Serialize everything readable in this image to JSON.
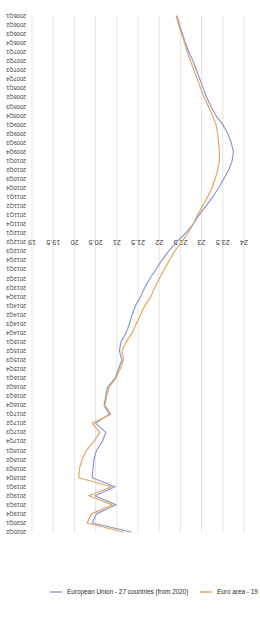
{
  "chart_data": {
    "type": "line",
    "title": "",
    "subtitle": "",
    "xlabel": "",
    "ylabel": "",
    "orientation": "rotated-90",
    "grid": true,
    "legend_position": "right",
    "ylim": [
      19,
      24
    ],
    "yticks": [
      "24",
      "23.5",
      "23",
      "22.5",
      "22",
      "21.5",
      "21",
      "20.5",
      "20",
      "19.5",
      "19"
    ],
    "ytick_values": [
      24,
      23.5,
      23,
      22.5,
      22,
      21.5,
      21,
      20.5,
      20,
      19.5,
      19
    ],
    "categories": [
      "2006Q1",
      "2006Q2",
      "2006Q3",
      "2006Q4",
      "2007Q1",
      "2007Q2",
      "2007Q3",
      "2007Q4",
      "2008Q1",
      "2008Q2",
      "2008Q3",
      "2008Q4",
      "2009Q1",
      "2009Q2",
      "2009Q3",
      "2009Q4",
      "2010Q1",
      "2010Q2",
      "2010Q3",
      "2010Q4",
      "2011Q1",
      "2011Q2",
      "2011Q3",
      "2011Q4",
      "2012Q1",
      "2012Q2",
      "2012Q3",
      "2012Q4",
      "2013Q1",
      "2013Q2",
      "2013Q3",
      "2013Q4",
      "2014Q1",
      "2014Q2",
      "2014Q3",
      "2014Q4",
      "2015Q1",
      "2015Q2",
      "2015Q3",
      "2015Q4",
      "2016Q1",
      "2016Q2",
      "2016Q3",
      "2016Q4",
      "2017Q1",
      "2017Q2",
      "2017Q3",
      "2017Q4",
      "2018Q1",
      "2018Q2",
      "2018Q3",
      "2018Q4",
      "2019Q1",
      "2019Q2",
      "2019Q3",
      "2019Q4",
      "2020Q1",
      "2020Q2"
    ],
    "series": [
      {
        "name": "European Union - 27 countries (from 2020)",
        "color": "#8697d0",
        "values": [
          22.42,
          22.48,
          22.55,
          22.62,
          22.7,
          22.8,
          22.88,
          22.96,
          23.04,
          23.12,
          23.22,
          23.34,
          23.5,
          23.62,
          23.7,
          23.75,
          23.72,
          23.64,
          23.52,
          23.4,
          23.26,
          23.1,
          22.94,
          22.8,
          22.62,
          22.4,
          22.22,
          22.06,
          21.92,
          21.78,
          21.66,
          21.56,
          21.44,
          21.36,
          21.3,
          21.22,
          21.1,
          21.06,
          21.12,
          21.04,
          20.96,
          20.78,
          20.74,
          20.7,
          20.82,
          20.5,
          20.74,
          20.66,
          20.52,
          20.46,
          20.44,
          20.42,
          20.96,
          20.48,
          20.98,
          20.52,
          20.42,
          21.34
        ]
      },
      {
        "name": "Euro area - 19 countries (from 2015)",
        "color": "#e7a25d",
        "values": [
          22.4,
          22.46,
          22.53,
          22.6,
          22.66,
          22.74,
          22.82,
          22.9,
          22.98,
          23.06,
          23.16,
          23.26,
          23.34,
          23.38,
          23.4,
          23.42,
          23.42,
          23.38,
          23.32,
          23.24,
          23.14,
          23.02,
          22.9,
          22.8,
          22.68,
          22.52,
          22.36,
          22.24,
          22.12,
          22.0,
          21.9,
          21.8,
          21.66,
          21.56,
          21.46,
          21.36,
          21.22,
          21.12,
          21.16,
          21.08,
          20.98,
          20.82,
          20.76,
          20.72,
          20.86,
          20.42,
          20.6,
          20.46,
          20.28,
          20.18,
          20.12,
          20.1,
          20.88,
          20.34,
          20.9,
          20.4,
          20.3,
          21.16
        ]
      }
    ],
    "legend": [
      {
        "label": "European Union - 27 countries (from 2020)",
        "color": "#8697d0"
      },
      {
        "label": "Euro area - 19 countries (from 2015)",
        "color": "#e7a25d"
      }
    ],
    "colors": {
      "eu27": "#8697d0",
      "euro19": "#e7a25d",
      "grid": "#d9d9d9",
      "text": "#3a3a3a",
      "background": "#ffffff"
    }
  }
}
